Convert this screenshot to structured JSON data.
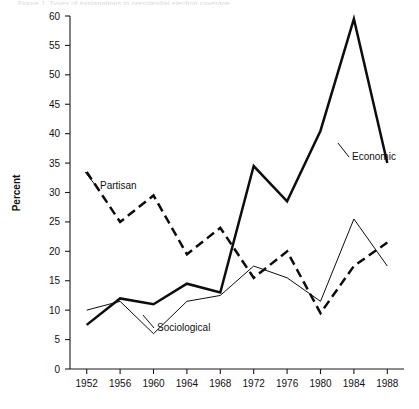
{
  "figure": {
    "top_caption_sliver": "Figure 1.  Types of explanations in presidential election coverage",
    "background_color": "#ffffff",
    "ink_color": "#111111"
  },
  "chart_data": {
    "type": "line",
    "title": "",
    "subtitle": "",
    "xlabel": "",
    "ylabel": "Percent",
    "x": [
      1952,
      1956,
      1960,
      1964,
      1968,
      1972,
      1976,
      1980,
      1984,
      1988
    ],
    "xtick_labels": [
      "1952",
      "1956",
      "1960",
      "1964",
      "1968",
      "1972",
      "1976",
      "1980",
      "1984",
      "1988"
    ],
    "ytick_labels": [
      "0",
      "5",
      "10",
      "15",
      "20",
      "25",
      "30",
      "35",
      "40",
      "45",
      "50",
      "55",
      "60"
    ],
    "yticks": [
      0,
      5,
      10,
      15,
      20,
      25,
      30,
      35,
      40,
      45,
      50,
      55,
      60
    ],
    "ylim": [
      0,
      60
    ],
    "xlim": [
      1950,
      1990
    ],
    "grid": false,
    "legend_position": "inline-annotations",
    "series": [
      {
        "name": "Economic",
        "style": "solid-thick",
        "color": "#0d0d0d",
        "label_text": "Economic",
        "values": [
          7.5,
          12.0,
          11.0,
          14.5,
          13.0,
          34.5,
          28.5,
          40.5,
          59.5,
          35.0
        ]
      },
      {
        "name": "Partisan",
        "style": "dashed",
        "color": "#0d0d0d",
        "label_text": "Partisan",
        "values": [
          33.5,
          25.0,
          29.5,
          19.5,
          24.0,
          15.5,
          20.0,
          9.5,
          17.5,
          21.5
        ]
      },
      {
        "name": "Sociological",
        "style": "solid-thin",
        "color": "#0d0d0d",
        "label_text": "Sociological",
        "values": [
          10.0,
          11.5,
          6.0,
          11.5,
          12.5,
          17.5,
          15.5,
          11.5,
          25.5,
          17.5
        ]
      }
    ],
    "annotations": [
      {
        "text": "Partisan",
        "series": "Partisan",
        "anchor_x": 1956,
        "anchor_y": 31.5
      },
      {
        "text": "Economic",
        "series": "Economic",
        "anchor_x": 1986,
        "anchor_y": 40.0
      },
      {
        "text": "Sociological",
        "series": "Sociological",
        "anchor_x": 1967,
        "anchor_y": 7.0
      }
    ]
  }
}
